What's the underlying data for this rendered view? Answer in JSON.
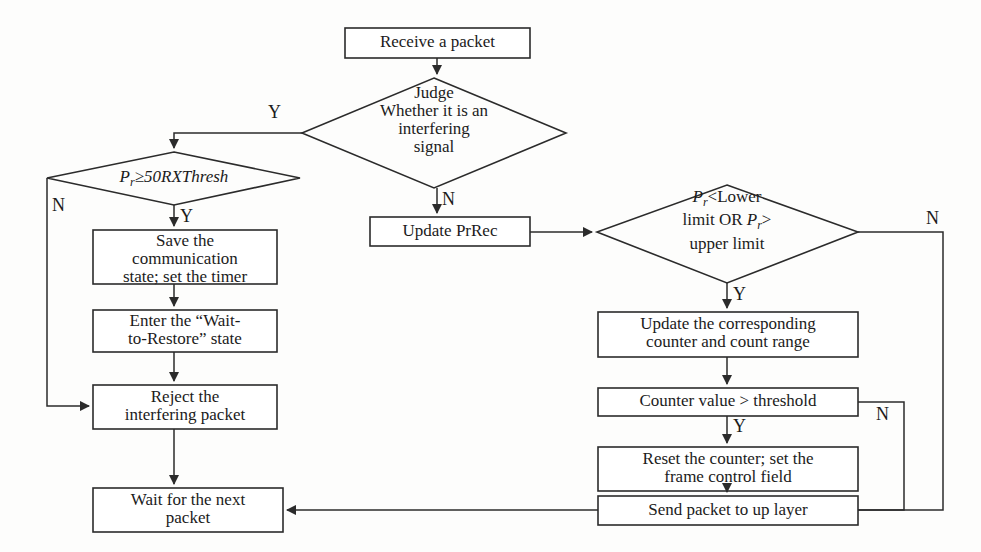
{
  "diagram": {
    "type": "flowchart",
    "stroke_color": "#2b2b2b",
    "background_color": "#fdfdfc"
  },
  "nodes": {
    "receive_packet": {
      "label": "Receive a packet",
      "shape": "process"
    },
    "judge_interfering": {
      "label": "Judge\nWhether it is an\ninterfering\nsignal",
      "shape": "decision"
    },
    "pr_threshold": {
      "label": "P",
      "sub": "r",
      "label_rest": "≥50RXThresh",
      "shape": "decision"
    },
    "save_state": {
      "label": "Save the\ncommunication\nstate; set the timer",
      "shape": "process"
    },
    "wait_to_restore": {
      "label": "Enter the “Wait-\nto-Restore” state",
      "shape": "process"
    },
    "reject_packet": {
      "label": "Reject the\ninterfering packet",
      "shape": "process"
    },
    "wait_next_packet": {
      "label": "Wait for the next\npacket",
      "shape": "process"
    },
    "update_prrec": {
      "label": "Update PrRec",
      "shape": "process"
    },
    "limit_check": {
      "line1_a": "P",
      "line1_sub": "r",
      "line1_b": "<Lower",
      "line2_a": "limit  OR ",
      "line2_b": "P",
      "line2_sub": "r",
      "line2_c": ">",
      "line3": "upper limit",
      "shape": "decision"
    },
    "update_counter": {
      "label": "Update the corresponding\ncounter and count range",
      "shape": "process"
    },
    "counter_threshold": {
      "label": "Counter value > threshold",
      "shape": "process"
    },
    "reset_counter": {
      "label": "Reset the counter; set the\nframe control field",
      "shape": "process"
    },
    "send_to_up_layer": {
      "label": "Send packet to up layer",
      "shape": "process"
    }
  },
  "edge_labels": {
    "judge_yes": "Y",
    "judge_no": "N",
    "pr_threshold_no": "N",
    "pr_threshold_yes": "Y",
    "limit_check_no": "N",
    "limit_check_yes": "Y",
    "counter_threshold_yes": "Y",
    "counter_threshold_no": "N"
  }
}
